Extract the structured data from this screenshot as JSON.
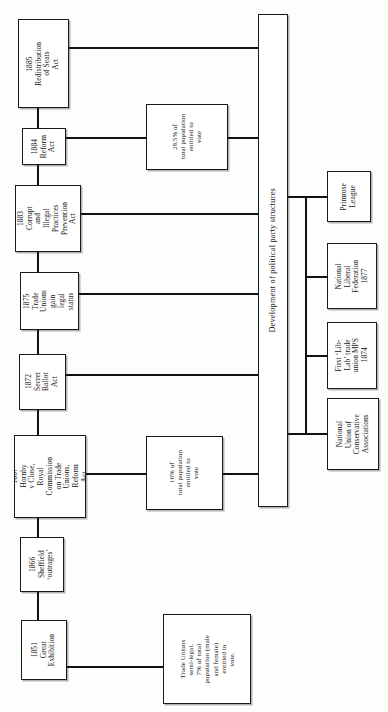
{
  "diagram": {
    "orientation": "rotated-90-ccw",
    "center_node": {
      "label": "Development of political party structures"
    },
    "timeline_events": [
      {
        "id": "e1885",
        "year": "1885",
        "text": "1885\nRedistribution\nof Seats\nAct"
      },
      {
        "id": "e1884",
        "year": "1884",
        "text": "1884\nReform\nAct"
      },
      {
        "id": "e1883",
        "year": "1883",
        "text": "1883\nCorrupt\nand\nIllegal\nPractices\nPrevention\nAct"
      },
      {
        "id": "e1875",
        "year": "1875",
        "text": "1875\nTrade\nUnions\ngain\nlegal\nstatus"
      },
      {
        "id": "e1872",
        "year": "1872",
        "text": "1872\nSecret\nBallot\nAct"
      },
      {
        "id": "e1867",
        "year": "1867",
        "text": "1867\nHornby\nv Close,\nRoyal\nCommission\non Trade\nUnions,\nReform\nAct."
      },
      {
        "id": "e1866",
        "year": "1866",
        "text": "1866\nSheffield\n‘outrages’"
      },
      {
        "id": "e1851",
        "year": "1851",
        "text": "1851\nGreat\nExhibition"
      }
    ],
    "detail_notes": [
      {
        "id": "note-1884",
        "text": "28.5% of\ntotal population\nentitled to\nvote"
      },
      {
        "id": "note-1867",
        "text": "16% of\ntotal population\nentitled to\nvote"
      },
      {
        "id": "note-1851",
        "text": "Trade Unions\nsemi-legal.\n7% of total\npopulation (male\nand female)\nentitled to\nvote."
      }
    ],
    "party_structures": [
      {
        "id": "primrose-league",
        "text": "Primrose\nLeague"
      },
      {
        "id": "national-liberal-federation",
        "text": "National\nLiberal\nFederation\n1877"
      },
      {
        "id": "lib-lab-mps",
        "text": "First ‘Lib-\nLab’ trade\nunion MPS\n1874"
      },
      {
        "id": "nat-union-cons-assoc",
        "text": "National\nUnion of\nConservative\nAssociations"
      }
    ],
    "colors": {
      "ink": "#141414",
      "paper": "#fdfdfb",
      "rule": "#1b1b1b"
    }
  }
}
